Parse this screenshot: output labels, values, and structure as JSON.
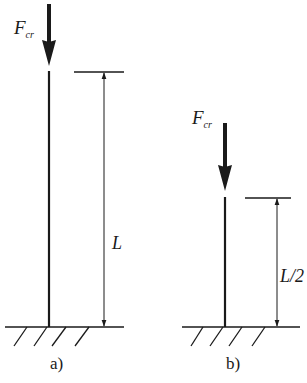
{
  "diagram": {
    "type": "buckling-columns",
    "colors": {
      "line": "#1a1a1a",
      "background": "#ffffff"
    },
    "panels": [
      {
        "id": "a",
        "caption": "a)",
        "force_symbol": "F",
        "force_subscript": "cr",
        "length_label": "L"
      },
      {
        "id": "b",
        "caption": "b)",
        "force_symbol": "F",
        "force_subscript": "cr",
        "length_label": "L/2"
      }
    ]
  }
}
